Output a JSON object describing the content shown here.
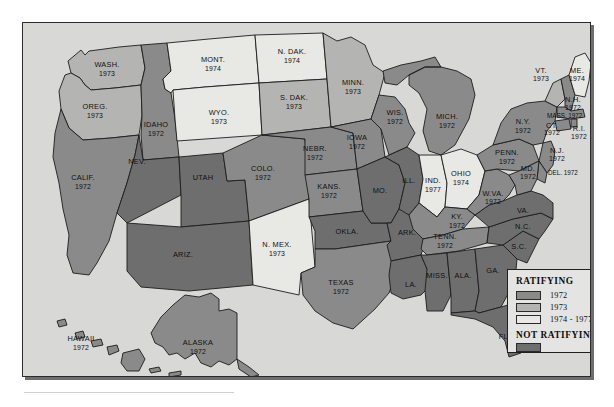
{
  "figure": {
    "name": "map-of-era-ratification",
    "frame_border_color": "#1c1c1c",
    "background_color": "#d8d8d6"
  },
  "legend": {
    "name": "map-legend",
    "title_ratifying": "RATIFYING",
    "title_not_ratifying": "NOT  RATIFYING",
    "entries": [
      {
        "label": "1972",
        "color": "#8a8a8a"
      },
      {
        "label": "1973",
        "color": "#b4b4b2"
      },
      {
        "label": "1974 - 1977",
        "color": "#e8e8e4"
      }
    ],
    "not_ratifying": {
      "label": "",
      "color": "#6e6e6e"
    }
  },
  "colors": {
    "c1972": "#8a8a8a",
    "c1973": "#b4b4b2",
    "c1974_1977": "#e8e8e4",
    "not_ratifying": "#6e6e6e",
    "water": "#d8d8d6",
    "border": "#1c1c1c"
  },
  "states": [
    {
      "id": "washington",
      "abbr": "WASH.",
      "year": "1973",
      "category": "1973"
    },
    {
      "id": "oregon",
      "abbr": "OREG.",
      "year": "1973",
      "category": "1973"
    },
    {
      "id": "idaho",
      "abbr": "IDAHO",
      "year": "1972",
      "category": "1972"
    },
    {
      "id": "montana",
      "abbr": "MONT.",
      "year": "1974",
      "category": "1974-1977"
    },
    {
      "id": "wyoming",
      "abbr": "WYO.",
      "year": "1973",
      "category": "1973"
    },
    {
      "id": "north-dakota",
      "abbr": "N. DAK.",
      "year": "1974",
      "category": "1974-1977"
    },
    {
      "id": "south-dakota",
      "abbr": "S. DAK.",
      "year": "1973",
      "category": "1973"
    },
    {
      "id": "minnesota",
      "abbr": "MINN.",
      "year": "1973",
      "category": "1973"
    },
    {
      "id": "wisconsin",
      "abbr": "WIS.",
      "year": "1972",
      "category": "1972"
    },
    {
      "id": "michigan",
      "abbr": "MICH.",
      "year": "1972",
      "category": "1972"
    },
    {
      "id": "nebraska",
      "abbr": "NEBR.",
      "year": "1972",
      "category": "1972"
    },
    {
      "id": "iowa",
      "abbr": "IOWA",
      "year": "1972",
      "category": "1972"
    },
    {
      "id": "california",
      "abbr": "CALIF.",
      "year": "1972",
      "category": "1972"
    },
    {
      "id": "nevada",
      "abbr": "NEV.",
      "year": "",
      "category": "not-ratifying"
    },
    {
      "id": "utah",
      "abbr": "UTAH",
      "year": "",
      "category": "not-ratifying"
    },
    {
      "id": "colorado",
      "abbr": "COLO.",
      "year": "1972",
      "category": "1972"
    },
    {
      "id": "kansas",
      "abbr": "KANS.",
      "year": "1972",
      "category": "1972"
    },
    {
      "id": "missouri",
      "abbr": "MO.",
      "year": "",
      "category": "not-ratifying"
    },
    {
      "id": "illinois",
      "abbr": "ILL.",
      "year": "",
      "category": "not-ratifying"
    },
    {
      "id": "indiana",
      "abbr": "IND.",
      "year": "1977",
      "category": "1974-1977"
    },
    {
      "id": "ohio",
      "abbr": "OHIO",
      "year": "1974",
      "category": "1974-1977"
    },
    {
      "id": "arizona",
      "abbr": "ARIZ.",
      "year": "",
      "category": "not-ratifying"
    },
    {
      "id": "new-mexico",
      "abbr": "N. MEX.",
      "year": "1973",
      "category": "1973"
    },
    {
      "id": "oklahoma",
      "abbr": "OKLA.",
      "year": "",
      "category": "not-ratifying"
    },
    {
      "id": "arkansas",
      "abbr": "ARK.",
      "year": "",
      "category": "not-ratifying"
    },
    {
      "id": "texas",
      "abbr": "TEXAS",
      "year": "1972",
      "category": "1972"
    },
    {
      "id": "louisiana",
      "abbr": "LA.",
      "year": "",
      "category": "not-ratifying"
    },
    {
      "id": "mississippi",
      "abbr": "MISS.",
      "year": "",
      "category": "not-ratifying"
    },
    {
      "id": "alabama",
      "abbr": "ALA.",
      "year": "",
      "category": "not-ratifying"
    },
    {
      "id": "georgia",
      "abbr": "GA.",
      "year": "",
      "category": "not-ratifying"
    },
    {
      "id": "florida",
      "abbr": "FLA.",
      "year": "",
      "category": "not-ratifying"
    },
    {
      "id": "tennessee",
      "abbr": "TENN.",
      "year": "1972",
      "category": "1972"
    },
    {
      "id": "kentucky",
      "abbr": "KY.",
      "year": "1972",
      "category": "1972"
    },
    {
      "id": "west-virginia",
      "abbr": "W.VA.",
      "year": "1972",
      "category": "1972"
    },
    {
      "id": "virginia",
      "abbr": "VA.",
      "year": "",
      "category": "not-ratifying"
    },
    {
      "id": "north-carolina",
      "abbr": "N.C.",
      "year": "",
      "category": "not-ratifying"
    },
    {
      "id": "south-carolina",
      "abbr": "S.C.",
      "year": "",
      "category": "not-ratifying"
    },
    {
      "id": "pennsylvania",
      "abbr": "PENN.",
      "year": "1972",
      "category": "1972"
    },
    {
      "id": "new-york",
      "abbr": "N.Y.",
      "year": "1972",
      "category": "1972"
    },
    {
      "id": "vermont",
      "abbr": "VT.",
      "year": "1973",
      "category": "1973"
    },
    {
      "id": "maine",
      "abbr": "ME.",
      "year": "1974",
      "category": "1974-1977"
    },
    {
      "id": "new-hampshire",
      "abbr": "N.H.",
      "year": "1972",
      "category": "1972"
    },
    {
      "id": "massachusetts",
      "abbr": "MASS.",
      "year": "1972",
      "category": "1972"
    },
    {
      "id": "connecticut",
      "abbr": "CT.",
      "year": "1972",
      "category": "1972"
    },
    {
      "id": "rhode-island",
      "abbr": "R.I.",
      "year": "1972",
      "category": "1972"
    },
    {
      "id": "new-jersey",
      "abbr": "N.J.",
      "year": "1972",
      "category": "1972"
    },
    {
      "id": "delaware",
      "abbr": "DEL.",
      "year": "1972",
      "category": "1972"
    },
    {
      "id": "maryland",
      "abbr": "MD.",
      "year": "1972",
      "category": "1972"
    },
    {
      "id": "hawaii",
      "abbr": "HAWAII",
      "year": "1972",
      "category": "1972"
    },
    {
      "id": "alaska",
      "abbr": "ALASKA",
      "year": "1972",
      "category": "1972"
    }
  ],
  "labels": {
    "wash_name": "WASH.",
    "wash_year": "1973",
    "oreg_name": "OREG.",
    "oreg_year": "1973",
    "idaho_name": "IDAHO",
    "idaho_year": "1972",
    "mont_name": "MONT.",
    "mont_year": "1974",
    "wyo_name": "WYO.",
    "wyo_year": "1973",
    "ndak_name": "N. DAK.",
    "ndak_year": "1974",
    "sdak_name": "S. DAK.",
    "sdak_year": "1973",
    "minn_name": "MINN.",
    "minn_year": "1973",
    "wis_name": "WIS.",
    "wis_year": "1972",
    "mich_name": "MICH.",
    "mich_year": "1972",
    "nebr_name": "NEBR.",
    "nebr_year": "1972",
    "iowa_name": "IOWA",
    "iowa_year": "1972",
    "calif_name": "CALIF.",
    "calif_year": "1972",
    "nev_name": "NEV.",
    "utah_name": "UTAH",
    "colo_name": "COLO.",
    "colo_year": "1972",
    "kans_name": "KANS.",
    "kans_year": "1972",
    "mo_name": "MO.",
    "ill_name": "ILL.",
    "ind_name": "IND.",
    "ind_year": "1977",
    "ohio_name": "OHIO",
    "ohio_year": "1974",
    "ariz_name": "ARIZ.",
    "nmex_name": "N. MEX.",
    "nmex_year": "1973",
    "okla_name": "OKLA.",
    "ark_name": "ARK.",
    "texas_name": "TEXAS",
    "texas_year": "1972",
    "la_name": "LA.",
    "miss_name": "MISS.",
    "ala_name": "ALA.",
    "ga_name": "GA.",
    "fla_name": "FLA.",
    "tenn_name": "TENN.",
    "tenn_year": "1972",
    "ky_name": "KY.",
    "ky_year": "1972",
    "wva_name": "W.VA.",
    "wva_year": "1972",
    "va_name": "VA.",
    "nc_name": "N.C.",
    "sc_name": "S.C.",
    "penn_name": "PENN.",
    "penn_year": "1972",
    "ny_name": "N.Y.",
    "ny_year": "1972",
    "vt_name": "VT.",
    "vt_year": "1973",
    "me_name": "ME.",
    "me_year": "1974",
    "nh_name": "N.H.",
    "nh_year": "1972",
    "mass_name": "MASS. 1972",
    "ct_name": "CT.",
    "ct_year": "1972",
    "ri_name": "R.I.",
    "ri_year": "1972",
    "nj_name": "N.J.",
    "nj_year": "1972",
    "del_name": "DEL. 1972",
    "md_name": "MD.",
    "md_year": "1972",
    "hawaii_name": "HAWAII",
    "hawaii_year": "1972",
    "alaska_name": "ALASKA",
    "alaska_year": "1972"
  }
}
